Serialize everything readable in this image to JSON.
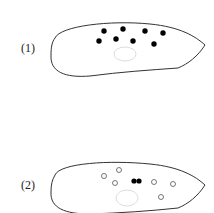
{
  "panels": [
    {
      "label": "(1)",
      "description": "cell with scattered filled granules near top"
    },
    {
      "label": "(2)",
      "description": "cell with open circles and a central pair of filled granules"
    }
  ],
  "colors": {
    "outline": "#333333",
    "nucleus": "#dddddd",
    "dot": "#000000"
  }
}
